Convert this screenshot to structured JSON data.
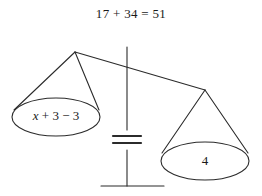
{
  "diagram": {
    "title_equation": "17 + 34 = 51",
    "type": "balance-scale",
    "equals_sign": "=",
    "left_pan": {
      "expression_variable": "x",
      "expression_rest": " + 3 − 3",
      "full_expression": "x + 3 − 3"
    },
    "right_pan": {
      "value": "4"
    },
    "colors": {
      "stroke": "#2b2b2b",
      "text": "#1a1a1a",
      "background": "#ffffff"
    }
  }
}
